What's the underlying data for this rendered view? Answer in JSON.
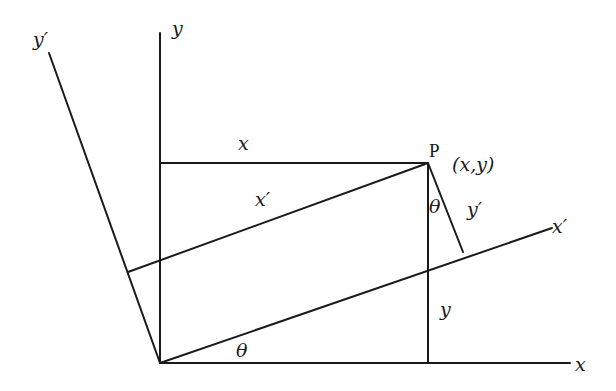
{
  "diagram": {
    "labels": {
      "y_axis": "y",
      "y_prime_axis": "y′",
      "x_axis": "x",
      "x_prime_axis": "x′",
      "x_segment": "x",
      "x_prime_segment": "x′",
      "y_segment": "y",
      "y_prime_segment": "y′",
      "point": "P",
      "point_coords": "(x,y)",
      "theta_origin": "θ",
      "theta_at_p": "θ"
    },
    "points": {
      "origin": [
        160,
        363
      ],
      "P": [
        428,
        163
      ]
    },
    "colors": {
      "line": "#1a1a1a",
      "background": "#ffffff"
    }
  }
}
